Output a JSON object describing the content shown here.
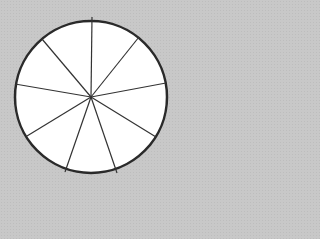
{
  "diagram": {
    "shape": "circle",
    "center": [
      91,
      97
    ],
    "radius": 76,
    "sector_count": 9,
    "spoke_endpoints": [
      [
        92,
        17
      ],
      [
        139,
        37
      ],
      [
        166,
        83
      ],
      [
        156,
        137
      ],
      [
        117,
        173
      ],
      [
        65,
        172
      ],
      [
        27,
        136
      ],
      [
        15,
        84
      ],
      [
        42,
        39
      ]
    ],
    "colors": {
      "background": "#c8c8c8",
      "fill": "#ffffff",
      "stroke": "#2a2a2a"
    }
  }
}
